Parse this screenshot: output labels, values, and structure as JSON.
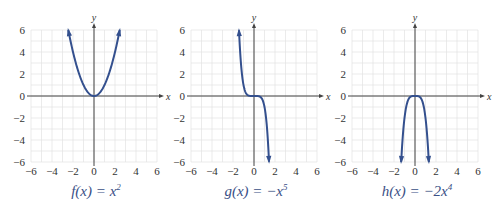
{
  "chart_data": [
    {
      "type": "line",
      "function": "x^2",
      "caption": "f(x) = x²",
      "caption_parts": {
        "name": "f",
        "var": "x",
        "rhs": "x",
        "exp": "2"
      },
      "xlabel": "x",
      "ylabel": "y",
      "xlim": [
        -6,
        6
      ],
      "ylim": [
        -6,
        6
      ],
      "xticks": [
        -6,
        -4,
        -2,
        0,
        2,
        4,
        6
      ],
      "yticks": [
        -6,
        -4,
        -2,
        0,
        2,
        4,
        6
      ],
      "grid": true,
      "domain": [
        -2.45,
        2.45
      ],
      "end_arrows": [
        "up",
        "up"
      ]
    },
    {
      "type": "line",
      "function": "-x^5",
      "caption": "g(x) = −x⁵",
      "caption_parts": {
        "name": "g",
        "var": "x",
        "rhs": "−x",
        "exp": "5"
      },
      "xlabel": "x",
      "ylabel": "y",
      "xlim": [
        -6,
        6
      ],
      "ylim": [
        -6,
        6
      ],
      "xticks": [
        -6,
        -4,
        -2,
        0,
        2,
        4,
        6
      ],
      "yticks": [
        -6,
        -4,
        -2,
        0,
        2,
        4,
        6
      ],
      "grid": true,
      "domain": [
        -1.43,
        1.43
      ],
      "end_arrows": [
        "up",
        "down"
      ]
    },
    {
      "type": "line",
      "function": "-2x^4",
      "caption": "h(x) = −2x⁴",
      "caption_parts": {
        "name": "h",
        "var": "x",
        "rhs": "−2x",
        "exp": "4"
      },
      "xlabel": "x",
      "ylabel": "y",
      "xlim": [
        -6,
        6
      ],
      "ylim": [
        -6,
        6
      ],
      "xticks": [
        -6,
        -4,
        -2,
        0,
        2,
        4,
        6
      ],
      "yticks": [
        -6,
        -4,
        -2,
        0,
        2,
        4,
        6
      ],
      "grid": true,
      "domain": [
        -1.32,
        1.32
      ],
      "end_arrows": [
        "down",
        "down"
      ]
    }
  ],
  "colors": {
    "curve": "#34508e",
    "caption": "#3a4f86",
    "grid": "#e2e2e2",
    "axis": "#444444"
  }
}
